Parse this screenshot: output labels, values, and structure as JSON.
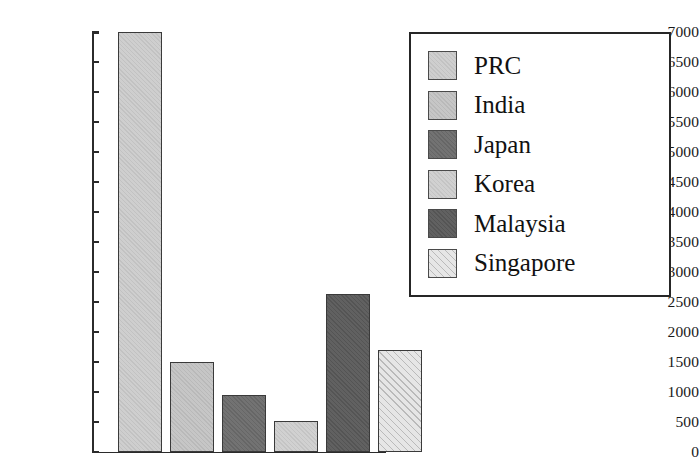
{
  "chart_data": {
    "type": "bar",
    "title": "",
    "xlabel": "",
    "ylabel": "",
    "categories": [
      "PRC",
      "India",
      "Japan",
      "Korea",
      "Malaysia",
      "Singapore"
    ],
    "values": [
      7000,
      1500,
      950,
      520,
      2630,
      1700
    ],
    "ylim": [
      0,
      7000
    ],
    "ytick_step": 500,
    "ytick_labels": [
      "7000",
      "6500",
      "6000",
      "5500",
      "5000",
      "4500",
      "4000",
      "3500",
      "3000",
      "2500",
      "2000",
      "1500",
      "1000",
      "500",
      "0"
    ],
    "ytick_values": [
      7000,
      6500,
      6000,
      5500,
      5000,
      4500,
      4000,
      3500,
      3000,
      2500,
      2000,
      1500,
      1000,
      500,
      0
    ],
    "grid": false,
    "xtick_labels": [],
    "legend_position": "right",
    "series_colors": [
      "#cccccc",
      "#c3c3c3",
      "#6b6b6b",
      "#cfcfcf",
      "#595959",
      "#e6e6e6"
    ],
    "series_patterns": [
      "solid",
      "solid",
      "solid",
      "solid",
      "solid",
      "diagonal-hatch"
    ],
    "axis_color": "#2b2b2b",
    "bar_edge_color": "#3a3a3a",
    "background_color": "#ffffff"
  },
  "legend": {
    "items": [
      {
        "label": "PRC",
        "color": "#cccccc",
        "pattern": "solid"
      },
      {
        "label": "India",
        "color": "#c3c3c3",
        "pattern": "solid"
      },
      {
        "label": "Japan",
        "color": "#6b6b6b",
        "pattern": "solid"
      },
      {
        "label": "Korea",
        "color": "#cfcfcf",
        "pattern": "solid"
      },
      {
        "label": "Malaysia",
        "color": "#595959",
        "pattern": "solid"
      },
      {
        "label": "Singapore",
        "color": "#e6e6e6",
        "pattern": "diagonal-hatch"
      }
    ]
  }
}
